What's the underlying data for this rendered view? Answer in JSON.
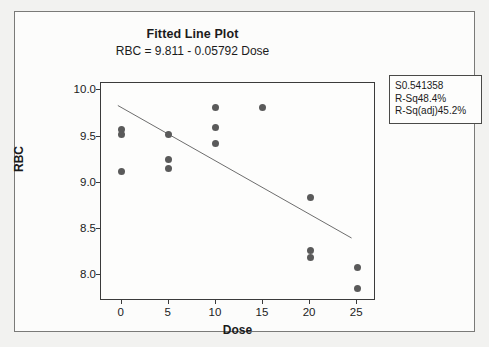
{
  "chart_data": {
    "type": "scatter",
    "title": "Fitted Line Plot",
    "subtitle": "RBC =  9.811 - 0.05792 Dose",
    "xlabel": "Dose",
    "ylabel": "RBC",
    "xlim": [
      -2.2,
      27.0
    ],
    "ylim": [
      7.72,
      10.08
    ],
    "xticks": [
      0,
      5,
      10,
      15,
      20,
      25
    ],
    "yticks": [
      8.0,
      8.5,
      9.0,
      9.5,
      10.0
    ],
    "ytick_labels": [
      "8.0",
      "8.5",
      "9.0",
      "9.5",
      "10.0"
    ],
    "xtick_labels": [
      "0",
      "5",
      "10",
      "15",
      "20",
      "25"
    ],
    "grid": false,
    "legend_position": "outside-right-top",
    "marker_color": "#5a5a5a",
    "line_color": "#6b6b6b",
    "points": [
      {
        "x": 0,
        "y": 9.58
      },
      {
        "x": 0,
        "y": 9.52
      },
      {
        "x": 0,
        "y": 9.12
      },
      {
        "x": 5,
        "y": 9.52
      },
      {
        "x": 5,
        "y": 9.25
      },
      {
        "x": 5,
        "y": 9.15
      },
      {
        "x": 10,
        "y": 9.81
      },
      {
        "x": 10,
        "y": 9.6
      },
      {
        "x": 10,
        "y": 9.43
      },
      {
        "x": 15,
        "y": 9.81
      },
      {
        "x": 20,
        "y": 8.84
      },
      {
        "x": 20,
        "y": 8.27
      },
      {
        "x": 20,
        "y": 8.19
      },
      {
        "x": 25,
        "y": 8.08
      },
      {
        "x": 25,
        "y": 7.85
      }
    ],
    "fit_line": {
      "intercept": 9.811,
      "slope": -0.05792,
      "x_start": -0.4,
      "x_end": 24.6
    },
    "annotations": {
      "s_label": "S",
      "s_value": "0.541358",
      "rsq_label": "R-Sq",
      "rsq_value": "48.4%",
      "rsq_adj_label": "R-Sq(adj)",
      "rsq_adj_value": "45.2%"
    }
  }
}
